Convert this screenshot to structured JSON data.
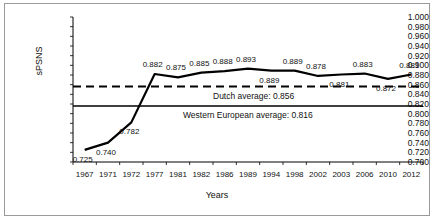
{
  "chart_data": {
    "type": "line",
    "title": "",
    "xlabel": "Years",
    "ylabel": "sPSNS",
    "categories": [
      "1967",
      "1971",
      "1972",
      "1977",
      "1981",
      "1982",
      "1986",
      "1989",
      "1994",
      "1998",
      "2002",
      "2003",
      "2006",
      "2010",
      "2012"
    ],
    "values": [
      0.725,
      0.74,
      0.782,
      0.882,
      0.875,
      0.885,
      0.888,
      0.893,
      0.889,
      0.889,
      0.878,
      0.881,
      0.883,
      0.872,
      0.881
    ],
    "point_labels": [
      "0.725",
      "0.740",
      "0.782",
      "0.882",
      "0.875",
      "0.885",
      "0.888",
      "0.893",
      "0.889",
      "0.889",
      "0.878",
      "0.881",
      "0.883",
      "0.872",
      "0.881"
    ],
    "label_positions": [
      "below",
      "below",
      "below",
      "above",
      "above",
      "above",
      "above",
      "above",
      "below",
      "above",
      "above",
      "below",
      "above",
      "below",
      "above"
    ],
    "ylim": [
      0.7,
      1.0
    ],
    "ytick_step": 0.02,
    "ytick_labels": [
      "1.000",
      "0.980",
      "0.960",
      "0.940",
      "0.920",
      "0.900",
      "0.880",
      "0.860",
      "0.840",
      "0.820",
      "0.800",
      "0.780",
      "0.760",
      "0.740",
      "0.720",
      "0.700"
    ],
    "grid": false,
    "legend": "none",
    "series_color": "#000000",
    "reference_lines": [
      {
        "name": "dutch-average",
        "label": "Dutch average: 0.856",
        "value": 0.856,
        "style": "dashed",
        "color": "#000000"
      },
      {
        "name": "western-european-average",
        "label": "Western European average: 0.816",
        "value": 0.816,
        "style": "solid",
        "color": "#000000"
      }
    ]
  }
}
